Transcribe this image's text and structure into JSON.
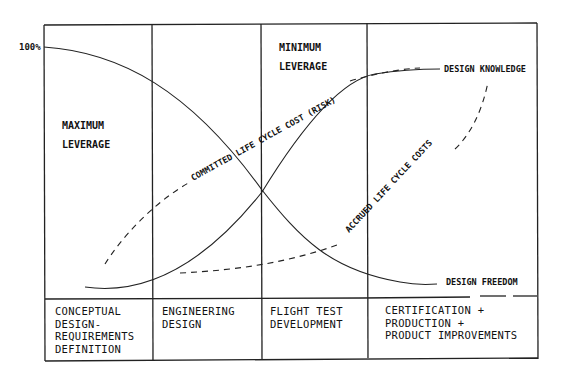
{
  "diagram": {
    "y_axis_label": "100%",
    "region_labels": {
      "max_leverage": [
        "MAXIMUM",
        "LEVERAGE"
      ],
      "min_leverage": [
        "MINIMUM",
        "LEVERAGE"
      ]
    },
    "curves": {
      "design_knowledge": "DESIGN KNOWLEDGE",
      "design_freedom": "DESIGN FREEDOM",
      "committed_cost": "COMMITTED LIFE CYCLE COST (RISK)",
      "accrued_cost": "ACCRUED LIFE CYCLE COSTS"
    },
    "phases": [
      {
        "label": "CONCEPTUAL\nDESIGN-\nREQUIREMENTS\nDEFINITION"
      },
      {
        "label": "ENGINEERING\nDESIGN"
      },
      {
        "label": "FLIGHT TEST\nDEVELOPMENT"
      },
      {
        "label": "CERTIFICATION +\nPRODUCTION +\nPRODUCT IMPROVEMENTS"
      }
    ]
  }
}
